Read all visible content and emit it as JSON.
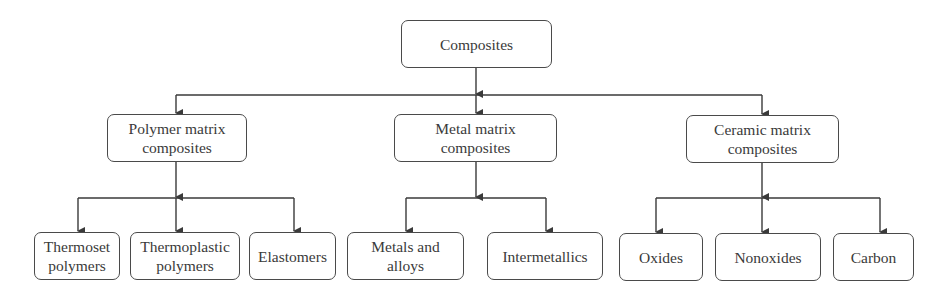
{
  "diagram": {
    "type": "hierarchy",
    "root": {
      "label": "Composites"
    },
    "categories": [
      {
        "label": "Polymer matrix\ncomposites",
        "children": [
          {
            "label": "Thermoset\npolymers"
          },
          {
            "label": "Thermoplastic\npolymers"
          },
          {
            "label": "Elastomers"
          }
        ]
      },
      {
        "label": "Metal matrix\ncomposites",
        "children": [
          {
            "label": "Metals and\nalloys"
          },
          {
            "label": "Intermetallics"
          }
        ]
      },
      {
        "label": "Ceramic matrix\ncomposites",
        "children": [
          {
            "label": "Oxides"
          },
          {
            "label": "Nonoxides"
          },
          {
            "label": "Carbon"
          }
        ]
      }
    ],
    "line_color": "#3a3a3a"
  }
}
